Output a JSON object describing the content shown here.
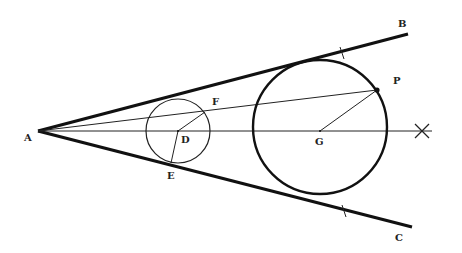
{
  "diagram": {
    "title": "",
    "colors": {
      "ink": "#111111",
      "background": "#ffffff"
    },
    "points": {
      "A": {
        "x": 38,
        "y": 131
      },
      "B": {
        "x": 408,
        "y": 34
      },
      "C": {
        "x": 412,
        "y": 227
      },
      "D": {
        "x": 178,
        "y": 131
      },
      "E": {
        "x": 171,
        "y": 163
      },
      "F": {
        "x": 205,
        "y": 112
      },
      "G": {
        "x": 320,
        "y": 131
      },
      "P": {
        "x": 377,
        "y": 90
      },
      "X": {
        "x": 422,
        "y": 131
      }
    },
    "labels": {
      "A": "A",
      "B": "B",
      "C": "C",
      "D": "D",
      "E": "E",
      "F": "F",
      "G": "G",
      "P": "P"
    },
    "circles": [
      {
        "name": "small-circle",
        "center": "D",
        "radius": 32
      },
      {
        "name": "large-circle",
        "center": "G",
        "radius": 67
      }
    ],
    "segments": [
      {
        "name": "ray-AB",
        "from": "A",
        "to": "B",
        "weight": "thick"
      },
      {
        "name": "ray-AC",
        "from": "A",
        "to": "C",
        "weight": "thick"
      },
      {
        "name": "bisector-AX",
        "from": "A",
        "to": "X",
        "weight": "thin"
      },
      {
        "name": "line-AP",
        "from": "A",
        "to": "P",
        "weight": "thin"
      },
      {
        "name": "radius-DF",
        "from": "D",
        "to": "F",
        "weight": "thin"
      },
      {
        "name": "radius-DE",
        "from": "D",
        "to": "E",
        "weight": "thin"
      },
      {
        "name": "radius-GP",
        "from": "G",
        "to": "P",
        "weight": "thin"
      }
    ],
    "tick_marks": [
      {
        "on": "AB",
        "x": 342,
        "y": 53
      },
      {
        "on": "AC",
        "x": 344,
        "y": 211
      }
    ]
  }
}
